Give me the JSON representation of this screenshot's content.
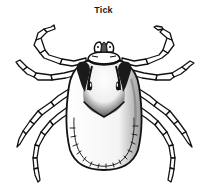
{
  "figure": {
    "title": "Tick",
    "style": "black and white line drawing",
    "colors": {
      "ink": "#111111",
      "background": "#ffffff"
    }
  }
}
